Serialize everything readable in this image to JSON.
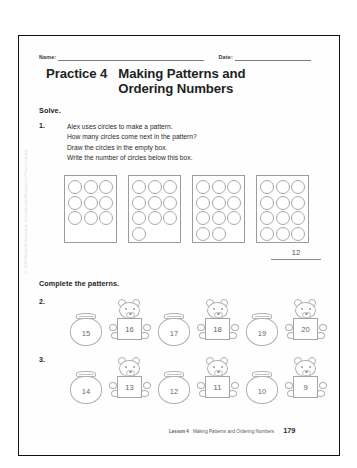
{
  "page": {
    "name_label": "Name:",
    "date_label": "Date:",
    "side_credit": "© 2009 Marshall Cavendish International (Singapore) Private Limited"
  },
  "title": {
    "practice_label": "Practice 4",
    "line1": "Making Patterns and",
    "line2": "Ordering Numbers"
  },
  "sections": {
    "solve_heading": "Solve.",
    "complete_heading": "Complete the patterns."
  },
  "question1": {
    "number": "1.",
    "lines": [
      "Alex uses circles to make a pattern.",
      "How many circles come next in the pattern?",
      "Draw the circles in the empty box.",
      "Write the number of circles below this box."
    ],
    "answer": "12",
    "boxes": [
      {
        "count": 9,
        "rows": [
          3,
          3,
          3
        ]
      },
      {
        "count": 10,
        "rows": [
          3,
          3,
          3,
          1
        ]
      },
      {
        "count": 11,
        "rows": [
          3,
          3,
          3,
          2
        ]
      },
      {
        "count": 12,
        "rows": [
          3,
          3,
          3,
          3
        ]
      }
    ]
  },
  "question2": {
    "number": "2.",
    "items": [
      {
        "type": "jar",
        "value": "15"
      },
      {
        "type": "bear",
        "value": "16"
      },
      {
        "type": "jar",
        "value": "17"
      },
      {
        "type": "bear",
        "value": "18"
      },
      {
        "type": "jar",
        "value": "19"
      },
      {
        "type": "bear",
        "value": "20"
      }
    ]
  },
  "question3": {
    "number": "3.",
    "items": [
      {
        "type": "jar",
        "value": "14"
      },
      {
        "type": "bear",
        "value": "13"
      },
      {
        "type": "jar",
        "value": "12"
      },
      {
        "type": "bear",
        "value": "11"
      },
      {
        "type": "jar",
        "value": "10"
      },
      {
        "type": "bear",
        "value": "9"
      }
    ]
  },
  "footer": {
    "lesson": "Lesson 4",
    "title": "Making Patterns and Ordering Numbers",
    "page_number": "179"
  }
}
